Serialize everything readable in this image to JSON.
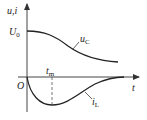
{
  "diagram": {
    "title": "",
    "axes": {
      "y_label": "u,i",
      "x_label": "t",
      "origin_label": "O"
    },
    "marks": {
      "initial_value_label": "U",
      "initial_value_sub": "0",
      "tm_label": "t",
      "tm_sub": "m"
    },
    "curves": [
      {
        "name": "u",
        "sub": "C",
        "description": "capacitor voltage decays monotonically from U0 toward 0"
      },
      {
        "name": "i",
        "sub": "L",
        "description": "inductor current starts at 0, reaches negative minimum at t_m, returns to 0"
      }
    ],
    "colors": {
      "line": "#222222",
      "axis": "#333333"
    }
  }
}
